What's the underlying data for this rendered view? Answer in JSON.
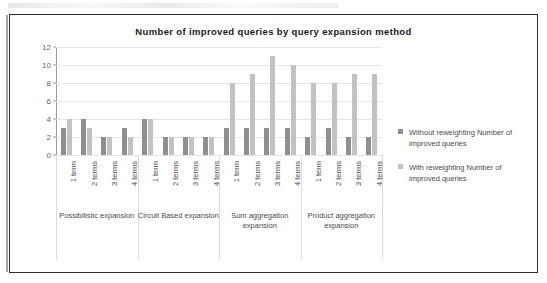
{
  "chart_data": {
    "type": "bar",
    "title": "Number of improved queries by query expansion method",
    "xlabel": "",
    "ylabel": "",
    "ylim": [
      0,
      12
    ],
    "yticks": [
      0,
      2,
      4,
      6,
      8,
      10,
      12
    ],
    "grid": true,
    "legend_position": "right",
    "orientation": "vertical-grouped",
    "categories": [
      "1 term",
      "2 terms",
      "3 terms",
      "4 terms",
      "1 term",
      "2 terms",
      "3 terms",
      "4 terms",
      "1 term",
      "2 terms",
      "3 terms",
      "4 terms",
      "1 term",
      "2 terms",
      "3 terms",
      "4 terms"
    ],
    "groups": [
      {
        "label": "Possibilistic expansion",
        "categories": [
          "1 term",
          "2 terms",
          "3 terms",
          "4 terms"
        ]
      },
      {
        "label": "Circuit Based expansion",
        "categories": [
          "1 term",
          "2 terms",
          "3 terms",
          "4 terms"
        ]
      },
      {
        "label": "Sum aggregation expansion",
        "categories": [
          "1 term",
          "2 terms",
          "3 terms",
          "4 terms"
        ]
      },
      {
        "label": "Product aggregation expansion",
        "categories": [
          "1 term",
          "2 terms",
          "3 terms",
          "4 terms"
        ]
      }
    ],
    "series": [
      {
        "name": "Without reweighting Number of improved queries",
        "color": "#8f8f8f",
        "values": [
          3,
          4,
          2,
          3,
          4,
          2,
          2,
          2,
          3,
          3,
          3,
          3,
          2,
          3,
          2,
          2
        ]
      },
      {
        "name": "With reweighting Number of improved queries",
        "color": "#c2c2c2",
        "values": [
          4,
          3,
          2,
          2,
          4,
          2,
          2,
          2,
          8,
          9,
          11,
          10,
          8,
          8,
          9,
          9
        ]
      }
    ]
  },
  "legend": {
    "items": [
      {
        "label": "Without reweighting Number of improved queries",
        "color": "#8f8f8f"
      },
      {
        "label": "With reweighting Number of improved queries",
        "color": "#c2c2c2"
      }
    ]
  }
}
